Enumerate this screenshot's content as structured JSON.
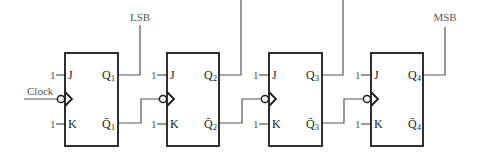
{
  "diagram": {
    "type": "4-bit asynchronous ripple counter (JK flip-flops)",
    "labels": {
      "lsb": "LSB",
      "msb": "MSB",
      "clock": "Clock"
    },
    "input_constant": "1",
    "flip_flops": [
      {
        "id": "FF1",
        "j": "J",
        "k": "K",
        "q": "Q",
        "qbar": "Q̄",
        "index": "1"
      },
      {
        "id": "FF2",
        "j": "J",
        "k": "K",
        "q": "Q",
        "qbar": "Q̄",
        "index": "2"
      },
      {
        "id": "FF3",
        "j": "J",
        "k": "K",
        "q": "Q",
        "qbar": "Q̄",
        "index": "3"
      },
      {
        "id": "FF4",
        "j": "J",
        "k": "K",
        "q": "Q",
        "qbar": "Q̄",
        "index": "4"
      }
    ],
    "colors": {
      "box_stroke": "#1a1a1a",
      "wire": "#555555",
      "background": "#ffffff"
    }
  }
}
